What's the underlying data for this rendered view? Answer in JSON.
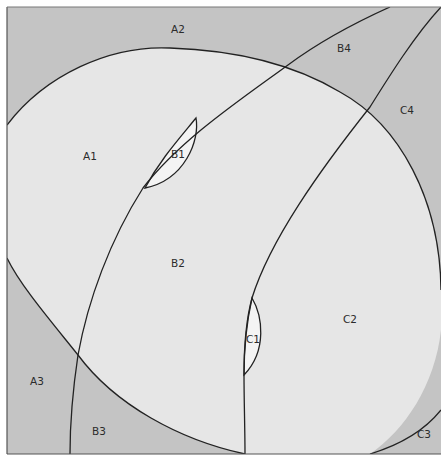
{
  "diagram": {
    "type": "region-partition",
    "colors": {
      "background": "#ffffff",
      "dark_region": "#c4c4c4",
      "light_region": "#e6e6e6",
      "lens_region": "#f4f4f4",
      "stroke": "#222222"
    },
    "regions": [
      {
        "id": "A1",
        "label": "A1",
        "x": 90,
        "y": 160,
        "shade": "light"
      },
      {
        "id": "A2",
        "label": "A2",
        "x": 178,
        "y": 33,
        "shade": "dark"
      },
      {
        "id": "A3",
        "label": "A3",
        "x": 37,
        "y": 385,
        "shade": "dark"
      },
      {
        "id": "B1",
        "label": "B1",
        "x": 178,
        "y": 158,
        "shade": "lens"
      },
      {
        "id": "B2",
        "label": "B2",
        "x": 178,
        "y": 267,
        "shade": "light"
      },
      {
        "id": "B3",
        "label": "B3",
        "x": 99,
        "y": 435,
        "shade": "dark"
      },
      {
        "id": "B4",
        "label": "B4",
        "x": 344,
        "y": 52,
        "shade": "dark"
      },
      {
        "id": "C1",
        "label": "C1",
        "x": 253,
        "y": 343,
        "shade": "lens"
      },
      {
        "id": "C2",
        "label": "C2",
        "x": 350,
        "y": 323,
        "shade": "light"
      },
      {
        "id": "C3",
        "label": "C3",
        "x": 424,
        "y": 438,
        "shade": "dark"
      },
      {
        "id": "C4",
        "label": "C4",
        "x": 407,
        "y": 114,
        "shade": "dark"
      }
    ]
  }
}
